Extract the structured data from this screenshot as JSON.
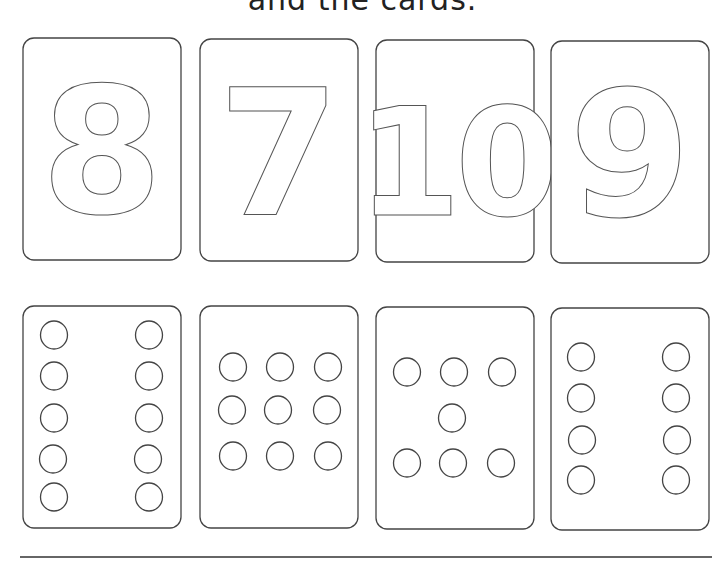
{
  "heading": "and the cards.",
  "numeral_cards": [
    {
      "value": "8",
      "x": 23,
      "y": 38
    },
    {
      "value": "7",
      "x": 200,
      "y": 39
    },
    {
      "value": "10",
      "x": 376,
      "y": 40
    },
    {
      "value": "9",
      "x": 551,
      "y": 41
    }
  ],
  "dot_cards": [
    {
      "count": 10,
      "x": 23,
      "y": 306,
      "dots": [
        [
          54,
          335
        ],
        [
          149,
          335
        ],
        [
          54,
          376
        ],
        [
          149,
          376
        ],
        [
          54,
          418
        ],
        [
          149,
          418
        ],
        [
          53,
          459
        ],
        [
          148,
          459
        ],
        [
          54,
          497
        ],
        [
          149,
          497
        ]
      ]
    },
    {
      "count": 9,
      "x": 200,
      "y": 306,
      "dots": [
        [
          233,
          367
        ],
        [
          280,
          367
        ],
        [
          328,
          367
        ],
        [
          232,
          410
        ],
        [
          278,
          410
        ],
        [
          327,
          410
        ],
        [
          233,
          456
        ],
        [
          280,
          456
        ],
        [
          328,
          456
        ]
      ]
    },
    {
      "count": 7,
      "x": 376,
      "y": 307,
      "dots": [
        [
          407,
          372
        ],
        [
          454,
          372
        ],
        [
          502,
          372
        ],
        [
          452,
          418
        ],
        [
          407,
          463
        ],
        [
          453,
          463
        ],
        [
          501,
          463
        ]
      ]
    },
    {
      "count": 8,
      "x": 551,
      "y": 308,
      "dots": [
        [
          581,
          357
        ],
        [
          676,
          357
        ],
        [
          581,
          398
        ],
        [
          676,
          398
        ],
        [
          582,
          440
        ],
        [
          677,
          440
        ],
        [
          581,
          480
        ],
        [
          676,
          480
        ]
      ]
    }
  ],
  "card_size": {
    "w": 158,
    "h": 222
  },
  "colors": {
    "stroke": "#444444",
    "background": "#ffffff"
  }
}
